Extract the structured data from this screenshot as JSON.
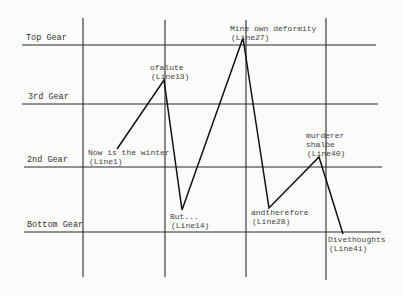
{
  "diagram": {
    "type": "gear-shift plot",
    "gears": [
      {
        "label": "Top Gear",
        "y": 45
      },
      {
        "label": "3rd Gear",
        "y": 104
      },
      {
        "label": "2nd Gear",
        "y": 167
      },
      {
        "label": "Bottom Gear",
        "y": 232
      }
    ],
    "vertical_lines_x": [
      83,
      165,
      246,
      326
    ],
    "points": [
      {
        "text": "Now is the winter",
        "line": "(Line1)",
        "x": 117,
        "y": 149,
        "label_x": 88,
        "label_y": 155
      },
      {
        "text": "ofalute",
        "line": "(Line13)",
        "x": 164,
        "y": 80,
        "label_x": 150,
        "label_y": 67
      },
      {
        "text": "But...",
        "line": "(Line14)",
        "x": 182,
        "y": 210,
        "label_x": 170,
        "label_y": 217
      },
      {
        "text": "Mine own deformity",
        "line": "(Line27)",
        "x": 243,
        "y": 38,
        "label_x": 230,
        "label_y": 30
      },
      {
        "text": "andtherefore",
        "line": "(Line28)",
        "x": 269,
        "y": 208,
        "label_x": 251,
        "label_y": 215
      },
      {
        "text": "murderer shalbe",
        "line": "(Line40)",
        "x": 319,
        "y": 157,
        "label_x": 306,
        "label_y": 137
      },
      {
        "text": "Divethoughts",
        "line": "(Line41)",
        "x": 343,
        "y": 234,
        "label_x": 328,
        "label_y": 241
      }
    ]
  }
}
